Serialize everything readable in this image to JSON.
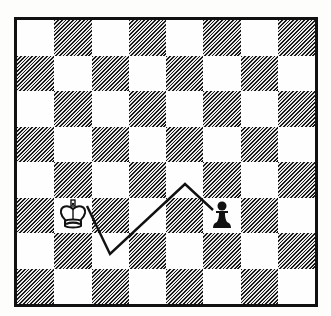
{
  "diagram": {
    "type": "chess-position",
    "files": 8,
    "ranks": 8,
    "colors": {
      "border": "#111111",
      "light_square": "#fefefe",
      "dark_square_hatch": "#1a1a1a",
      "path_line": "#111111"
    },
    "pieces": [
      {
        "name": "white-king",
        "symbol": "♔",
        "square": "b3",
        "col": 1,
        "row": 5
      },
      {
        "name": "black-pawn",
        "symbol": "♟",
        "square": "f3",
        "col": 5,
        "row": 5
      }
    ],
    "path": {
      "description": "Zig-zag route from king to pawn",
      "points_px": [
        [
          70,
          186
        ],
        [
          93,
          234
        ],
        [
          168,
          164
        ],
        [
          196,
          190
        ]
      ]
    }
  }
}
